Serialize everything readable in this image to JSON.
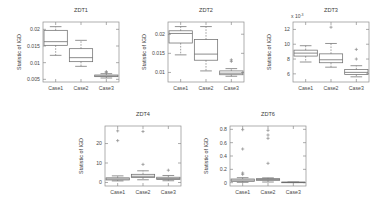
{
  "figure": {
    "background": "#ffffff",
    "line_color": "#7a7a7a",
    "text_color": "#3c3c3c"
  },
  "chart_data": [
    {
      "id": "zdt1",
      "type": "box",
      "title": "ZDT1",
      "xlabel": "",
      "ylabel": "Statistic of IGD",
      "categories": [
        "Case1",
        "Case2",
        "Case3"
      ],
      "yticks": [
        0.005,
        0.01,
        0.015,
        0.02
      ],
      "ytick_labels": [
        "0.005",
        "0.01",
        "0.015",
        "0.02"
      ],
      "ylim": [
        0.0042,
        0.0222
      ],
      "exponent_label": "",
      "grid": false,
      "legend": "none",
      "boxes": [
        {
          "category": "Case1",
          "min": 0.0122,
          "q1": 0.0152,
          "median": 0.0163,
          "q3": 0.0197,
          "max": 0.0208,
          "outliers": []
        },
        {
          "category": "Case2",
          "min": 0.0089,
          "q1": 0.0103,
          "median": 0.0115,
          "q3": 0.0142,
          "max": 0.0167,
          "outliers": []
        },
        {
          "category": "Case3",
          "min": 0.0054,
          "q1": 0.0058,
          "median": 0.006,
          "q3": 0.0063,
          "max": 0.0067,
          "outliers": [
            0.0071,
            0.0073
          ]
        }
      ]
    },
    {
      "id": "zdt2",
      "type": "box",
      "title": "ZDT2",
      "xlabel": "",
      "ylabel": "Statistic of IGD",
      "categories": [
        "Case1",
        "Case2",
        "Case3"
      ],
      "yticks": [
        0.01,
        0.015,
        0.02
      ],
      "ytick_labels": [
        "0.01",
        "0.015",
        "0.02"
      ],
      "ylim": [
        0.0075,
        0.0232
      ],
      "exponent_label": "",
      "grid": false,
      "legend": "none",
      "boxes": [
        {
          "category": "Case1",
          "min": 0.0146,
          "q1": 0.0177,
          "median": 0.0202,
          "q3": 0.0209,
          "max": 0.022,
          "outliers": []
        },
        {
          "category": "Case2",
          "min": 0.0104,
          "q1": 0.0132,
          "median": 0.0148,
          "q3": 0.0186,
          "max": 0.022,
          "outliers": []
        },
        {
          "category": "Case3",
          "min": 0.009,
          "q1": 0.0094,
          "median": 0.0098,
          "q3": 0.0104,
          "max": 0.011,
          "outliers": [
            0.0129,
            0.0133
          ]
        }
      ]
    },
    {
      "id": "zdt3",
      "type": "box",
      "title": "ZDT3",
      "xlabel": "",
      "ylabel": "Statistic of IGD",
      "categories": [
        "Case1",
        "Case2",
        "Case3"
      ],
      "yticks": [
        6,
        8,
        10,
        12
      ],
      "ytick_labels": [
        "6",
        "8",
        "10",
        "12"
      ],
      "ylim": [
        4.9,
        13.0
      ],
      "exponent_label": "x 10",
      "exponent_power": "-3",
      "grid": false,
      "legend": "none",
      "boxes": [
        {
          "category": "Case1",
          "min": 7.6,
          "q1": 8.4,
          "median": 8.8,
          "q3": 9.2,
          "max": 9.8,
          "outliers": []
        },
        {
          "category": "Case2",
          "min": 6.9,
          "q1": 7.5,
          "median": 7.9,
          "q3": 8.7,
          "max": 10.1,
          "outliers": [
            12.3
          ]
        },
        {
          "category": "Case3",
          "min": 5.6,
          "q1": 5.9,
          "median": 6.2,
          "q3": 6.6,
          "max": 7.1,
          "outliers": [
            8.0,
            9.3
          ]
        }
      ]
    },
    {
      "id": "zdt4",
      "type": "box",
      "title": "ZDT4",
      "xlabel": "",
      "ylabel": "Statistic of IGD",
      "categories": [
        "Case1",
        "Case2",
        "Case3"
      ],
      "yticks": [
        0,
        10,
        20
      ],
      "ytick_labels": [
        "0",
        "10",
        "20"
      ],
      "ylim": [
        -1.8,
        29.0
      ],
      "exponent_label": "",
      "grid": false,
      "legend": "none",
      "boxes": [
        {
          "category": "Case1",
          "min": 0.8,
          "q1": 1.3,
          "median": 1.8,
          "q3": 2.4,
          "max": 3.4,
          "outliers": [
            21.5,
            26.5
          ]
        },
        {
          "category": "Case2",
          "min": 1.4,
          "q1": 2.6,
          "median": 3.2,
          "q3": 4.2,
          "max": 6.0,
          "outliers": [
            9.3,
            26.2
          ]
        },
        {
          "category": "Case3",
          "min": 0.9,
          "q1": 1.5,
          "median": 2.0,
          "q3": 2.7,
          "max": 3.6,
          "outliers": [
            6.3
          ]
        }
      ]
    },
    {
      "id": "zdt6",
      "type": "box",
      "title": "ZDT6",
      "xlabel": "",
      "ylabel": "Statistic of IGD",
      "categories": [
        "Case1",
        "Case2",
        "Case3"
      ],
      "yticks": [
        0,
        0.2,
        0.4,
        0.6,
        0.8
      ],
      "ytick_labels": [
        "0",
        "0.2",
        "0.4",
        "0.6",
        "0.8"
      ],
      "ylim": [
        -0.05,
        0.85
      ],
      "exponent_label": "",
      "grid": false,
      "legend": "none",
      "boxes": [
        {
          "category": "Case1",
          "min": 0.005,
          "q1": 0.02,
          "median": 0.038,
          "q3": 0.055,
          "max": 0.075,
          "outliers": [
            0.125,
            0.145,
            0.505,
            0.795
          ]
        },
        {
          "category": "Case2",
          "min": 0.01,
          "q1": 0.035,
          "median": 0.048,
          "q3": 0.06,
          "max": 0.072,
          "outliers": [
            0.29,
            0.665,
            0.715,
            0.785
          ]
        },
        {
          "category": "Case3",
          "min": 0.002,
          "q1": 0.004,
          "median": 0.006,
          "q3": 0.008,
          "max": 0.01,
          "outliers": []
        }
      ]
    }
  ],
  "panels_layout": [
    {
      "id": "zdt1",
      "left": 0,
      "top": 0,
      "width": 125,
      "height": 104
    },
    {
      "id": "zdt2",
      "left": 125,
      "top": 0,
      "width": 125,
      "height": 104
    },
    {
      "id": "zdt3",
      "left": 250,
      "top": 0,
      "width": 125,
      "height": 104
    },
    {
      "id": "zdt4",
      "left": 62,
      "top": 104,
      "width": 125,
      "height": 104
    },
    {
      "id": "zdt6",
      "left": 187,
      "top": 104,
      "width": 125,
      "height": 104
    }
  ]
}
